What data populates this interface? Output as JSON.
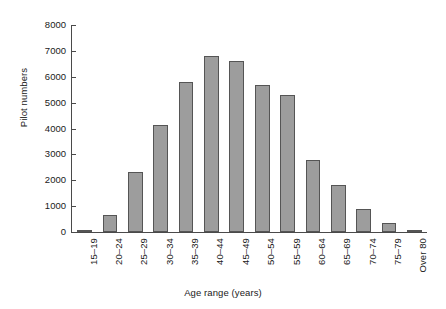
{
  "chart_data": {
    "type": "bar",
    "title": "",
    "xlabel": "Age range (years)",
    "ylabel": "Pilot numbers",
    "categories": [
      "15–19",
      "20–24",
      "25–29",
      "30–34",
      "35–39",
      "40–44",
      "45–49",
      "50–54",
      "55–59",
      "60–64",
      "65–69",
      "70–74",
      "75–79",
      "Over 80"
    ],
    "values": [
      80,
      650,
      2320,
      4150,
      5800,
      6800,
      6600,
      5700,
      5300,
      2800,
      1800,
      880,
      350,
      80
    ],
    "ylim": [
      0,
      8000
    ],
    "yticks": [
      0,
      1000,
      2000,
      3000,
      4000,
      5000,
      6000,
      7000,
      8000
    ],
    "ytick_labels": [
      "0",
      "1000",
      "2000",
      "3000",
      "4000",
      "5000",
      "6000",
      "7000",
      "8000"
    ],
    "grid": false,
    "legend": null,
    "bar_fill_color": "#9d9d9d",
    "bar_edge_color": "#555555",
    "axis_color": "#4a4a4a",
    "background_color": "#ffffff"
  }
}
